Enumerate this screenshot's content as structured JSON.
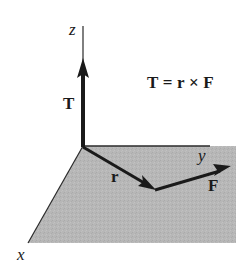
{
  "diagram": {
    "type": "vector-cross-product",
    "equation": "T = r × F",
    "axes": {
      "z": "z",
      "y": "y",
      "x": "x"
    },
    "vectors": {
      "T": "T",
      "r": "r",
      "F": "F"
    },
    "colors": {
      "plane_fill": "#b7b7b7",
      "ink": "#1a1a1a",
      "background": "#ffffff"
    }
  }
}
